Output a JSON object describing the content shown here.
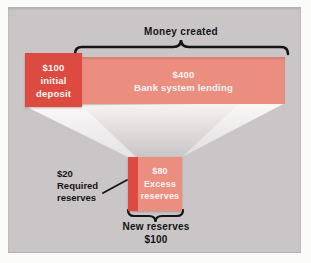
{
  "colors": {
    "page_bg": "#fbfbfa",
    "panel_bg": "#cac6c7",
    "deposit_red": "#dd4a40",
    "lending_salmon": "#eb8e80",
    "box_text": "#fdf5f3",
    "label_text": "#141414",
    "line_ink": "#141414"
  },
  "header": {
    "money_created_label": "Money created"
  },
  "main_bar": {
    "deposit": {
      "amount": "$100",
      "label": "initial deposit"
    },
    "lending": {
      "amount": "$400",
      "label": "Bank system lending"
    }
  },
  "reserves": {
    "required": {
      "amount": "$20",
      "label": "Required reserves"
    },
    "excess": {
      "amount": "$80",
      "label": "Excess reserves"
    }
  },
  "footer": {
    "new_reserves_label": "New reserves",
    "new_reserves_amount": "$100"
  }
}
